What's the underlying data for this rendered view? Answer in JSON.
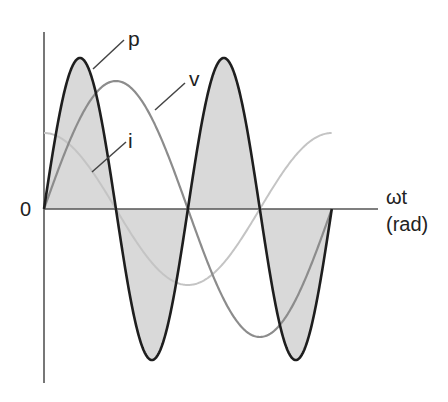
{
  "figure": {
    "width": 448,
    "height": 402,
    "origin_label": "0",
    "x_axis_label_line1": "ωt",
    "x_axis_label_line2": "(rad)",
    "curve_labels": {
      "p": "p",
      "v": "v",
      "i": "i"
    },
    "colors": {
      "background": "#ffffff",
      "axis": "#555555",
      "p_curve": "#1e1e1e",
      "p_fill": "#d9d9d9",
      "v_curve": "#8c8c8c",
      "i_curve": "#c4c4c4",
      "leader": "#444444",
      "text": "#222222"
    },
    "geometry": {
      "origin_x": 44,
      "zero_y": 209,
      "x_axis_end": 378,
      "y_axis_top": 32,
      "y_axis_bottom": 383,
      "px_per_rad": 45.8,
      "v_amp": 128,
      "i_amp": 76,
      "p_amp": 151,
      "i_end_rad": 6.28
    }
  },
  "chart_data": {
    "type": "line",
    "title": "",
    "xlabel": "ωt (rad)",
    "ylabel": "",
    "x_range": [
      0,
      6.28
    ],
    "grid": false,
    "legend": "inline labels with leader lines",
    "series": [
      {
        "name": "v",
        "formula": "Vm·sin(ωt)",
        "relative_amplitude": 1.0,
        "x": [
          0,
          1.571,
          3.142,
          4.712,
          6.283
        ],
        "values": [
          0,
          1,
          0,
          -1,
          0
        ]
      },
      {
        "name": "i",
        "formula": "Im·cos(ωt) (leads v by 90°)",
        "relative_amplitude": 0.59,
        "x": [
          0,
          1.571,
          3.142,
          4.712,
          6.283
        ],
        "values": [
          0.59,
          0,
          -0.59,
          0,
          0.59
        ]
      },
      {
        "name": "p",
        "formula": "v·i = ½·Vm·Im·sin(2ωt)",
        "relative_amplitude": 1.18,
        "x": [
          0,
          0.785,
          1.571,
          2.356,
          3.142,
          3.927,
          4.712,
          5.498,
          6.283
        ],
        "values": [
          0,
          1.18,
          0,
          -1.18,
          0,
          1.18,
          0,
          -1.18,
          0
        ],
        "shaded": true
      }
    ],
    "annotations": [
      "0 at origin",
      "p",
      "v",
      "i",
      "ωt (rad)"
    ]
  }
}
